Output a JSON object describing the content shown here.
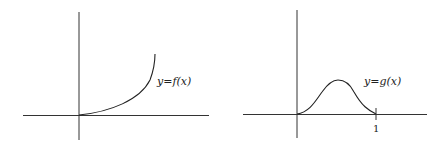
{
  "figures": [
    {
      "id": "left",
      "label": "y=f(x)",
      "description": "Increasing convex curve starting at the origin",
      "axis_color": "#333333",
      "curve_color": "#222222"
    },
    {
      "id": "right",
      "label": "y=g(x)",
      "description": "Bump function zero at 0 and 1, peaking in between",
      "tick_label": "1",
      "axis_color": "#333333",
      "curve_color": "#222222"
    }
  ]
}
